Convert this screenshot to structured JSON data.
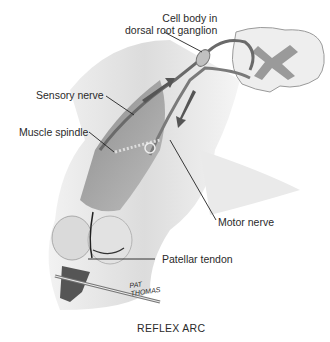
{
  "diagram": {
    "title": "REFLEX ARC",
    "labels": {
      "cell_body_line1": "Cell body in",
      "cell_body_line2": "dorsal root ganglion",
      "sensory_nerve": "Sensory nerve",
      "muscle_spindle": "Muscle spindle",
      "motor_nerve": "Motor nerve",
      "patellar_tendon": "Patellar tendon"
    },
    "signature_line1": "PAT",
    "signature_line2": "THOMAS",
    "colors": {
      "leg_fill": "#e6e6e6",
      "leg_shadow": "#c8c8c8",
      "muscle": "#8f8f8f",
      "nerve": "#6a6a6a",
      "spinal_cord_white": "#eeeeee",
      "spinal_cord_grey": "#9a9a9a",
      "hammer": "#555555"
    }
  }
}
